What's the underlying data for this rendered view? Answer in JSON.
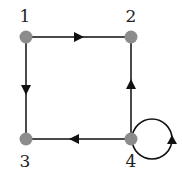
{
  "diagram": {
    "type": "directed-graph",
    "colors": {
      "node_fill": "#8c8c8c",
      "edge_stroke": "#4a4a4a",
      "arrow_fill": "#111111",
      "label": "#222222",
      "background": "#ffffff"
    },
    "nodes": [
      {
        "id": "1",
        "label": "1",
        "x": 26,
        "y": 37,
        "label_x": 25,
        "label_y": 22
      },
      {
        "id": "2",
        "label": "2",
        "x": 131,
        "y": 37,
        "label_x": 131,
        "label_y": 22
      },
      {
        "id": "3",
        "label": "3",
        "x": 26,
        "y": 139,
        "label_x": 25,
        "label_y": 167
      },
      {
        "id": "4",
        "label": "4",
        "x": 131,
        "y": 139,
        "label_x": 131,
        "label_y": 167
      }
    ],
    "edges": [
      {
        "from": "1",
        "to": "2",
        "arrow": "right"
      },
      {
        "from": "1",
        "to": "3",
        "arrow": "down"
      },
      {
        "from": "4",
        "to": "2",
        "arrow": "up"
      },
      {
        "from": "4",
        "to": "3",
        "arrow": "left"
      },
      {
        "from": "4",
        "to": "4",
        "type": "self-loop",
        "arrow": "up"
      }
    ]
  }
}
